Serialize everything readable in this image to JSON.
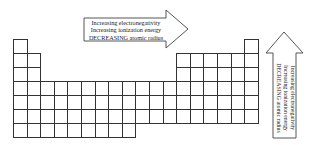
{
  "diagram": {
    "type": "periodic-table-trends",
    "horizontal_arrow": {
      "direction": "right",
      "lines": [
        "Increasing electronegativity",
        "Increasing ionization energy",
        "DECREASING atomic radius"
      ]
    },
    "vertical_arrow": {
      "direction": "up",
      "lines": [
        "Increasing electronegativity",
        "Increasing ionization energy",
        "DECREASING atomic radius"
      ]
    },
    "grid": {
      "columns": 18,
      "rows": 7,
      "row_layout": [
        {
          "row": 1,
          "columns": [
            1,
            18
          ]
        },
        {
          "row": 2,
          "columns": [
            1,
            2,
            13,
            14,
            15,
            16,
            17,
            18
          ]
        },
        {
          "row": 3,
          "columns": [
            1,
            2,
            13,
            14,
            15,
            16,
            17,
            18
          ]
        },
        {
          "row": 4,
          "columns": "1-18"
        },
        {
          "row": 5,
          "columns": "1-18"
        },
        {
          "row": 6,
          "columns": "1-18"
        },
        {
          "row": 7,
          "columns": "1-9"
        }
      ]
    },
    "colors": {
      "line": "#333333",
      "background": "#ffffff",
      "text": "#222222"
    }
  }
}
